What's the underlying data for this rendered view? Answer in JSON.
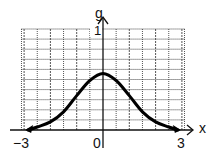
{
  "chart_data": {
    "type": "line",
    "title": "",
    "xlabel": "x",
    "ylabel": "g",
    "x_ticks": [
      "-3",
      "0",
      "3"
    ],
    "y_ticks": [
      "1"
    ],
    "xlim": [
      -3.1,
      3.1
    ],
    "ylim": [
      0,
      1
    ],
    "grid": true,
    "grid_x_step": 0.5,
    "grid_y_step": 0.1,
    "legend": null,
    "arrows_on_ends": true,
    "series": [
      {
        "name": "g(x)",
        "x": [
          -3,
          -2.5,
          -2,
          -1.5,
          -1,
          -0.5,
          0,
          0.5,
          1,
          1.5,
          2,
          2.5,
          3
        ],
        "y": [
          0.0,
          0.03,
          0.08,
          0.18,
          0.34,
          0.49,
          0.56,
          0.49,
          0.34,
          0.18,
          0.08,
          0.03,
          0.0
        ]
      }
    ]
  },
  "labels": {
    "y_axis": "g",
    "x_axis": "x",
    "y_one": "1",
    "x_neg3": "−3",
    "x_zero": "0",
    "x_pos3": "3"
  }
}
